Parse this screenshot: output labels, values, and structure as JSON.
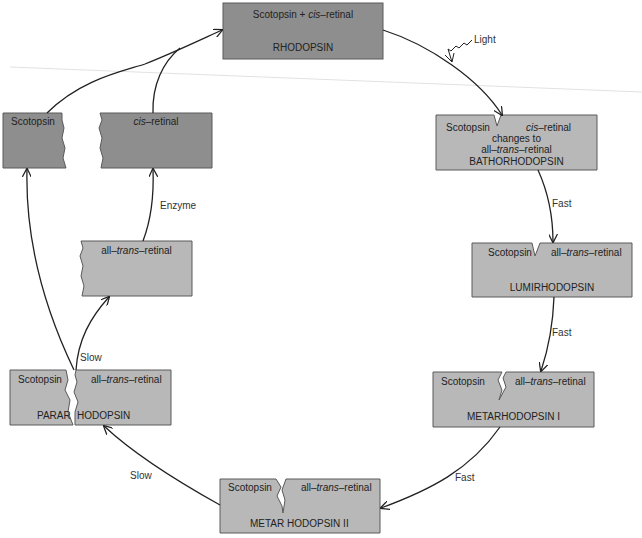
{
  "diagram": {
    "colors": {
      "dark_box": "#8e8e8e",
      "light_box": "#b8b8b8",
      "border": "#5a5a5a",
      "arrow": "#222222",
      "background": "#ffffff"
    },
    "nodes": {
      "rhodopsin": {
        "line1_a": "Scotopsin + ",
        "line1_italic": "cis",
        "line1_b": "–retinal",
        "name": "RHODOPSIN"
      },
      "scotopsin_free": {
        "label": "Scotopsin"
      },
      "cis_retinal_free": {
        "italic": "cis",
        "rest": "–retinal"
      },
      "all_trans_free": {
        "a": "all–",
        "italic": "trans",
        "b": "–retinal"
      },
      "bathorhodopsin": {
        "left": "Scotopsin",
        "right_italic": "cis",
        "right_rest": "–retinal",
        "line2": "changes to",
        "line3_a": "all–",
        "line3_italic": "trans",
        "line3_b": "–retinal",
        "name": "BATHORHODOPSIN"
      },
      "lumirhodopsin": {
        "left": "Scotopsin",
        "right_a": "all–",
        "right_italic": "trans",
        "right_b": "–retinal",
        "name": "LUMIRHODOPSIN"
      },
      "metarhodopsin_1": {
        "left": "Scotopsin",
        "right_a": "all–",
        "right_italic": "trans",
        "right_b": "–retinal",
        "name": "METARHODOPSIN I"
      },
      "metarhodopsin_2": {
        "left": "Scotopsin",
        "right_a": "all–",
        "right_italic": "trans",
        "right_b": "–retinal",
        "name_left": "METAR",
        "name_right": "HODOPSIN II"
      },
      "pararhodopsin": {
        "left": "Scotopsin",
        "right_a": "all–",
        "right_italic": "trans",
        "right_b": "–retinal",
        "name_left": "PARAR",
        "name_right": "HODOPSIN"
      }
    },
    "edge_labels": {
      "light": "Light",
      "fast_1": "Fast",
      "fast_2": "Fast",
      "fast_3": "Fast",
      "slow_1": "Slow",
      "slow_2": "Slow",
      "enzyme": "Enzyme"
    }
  }
}
